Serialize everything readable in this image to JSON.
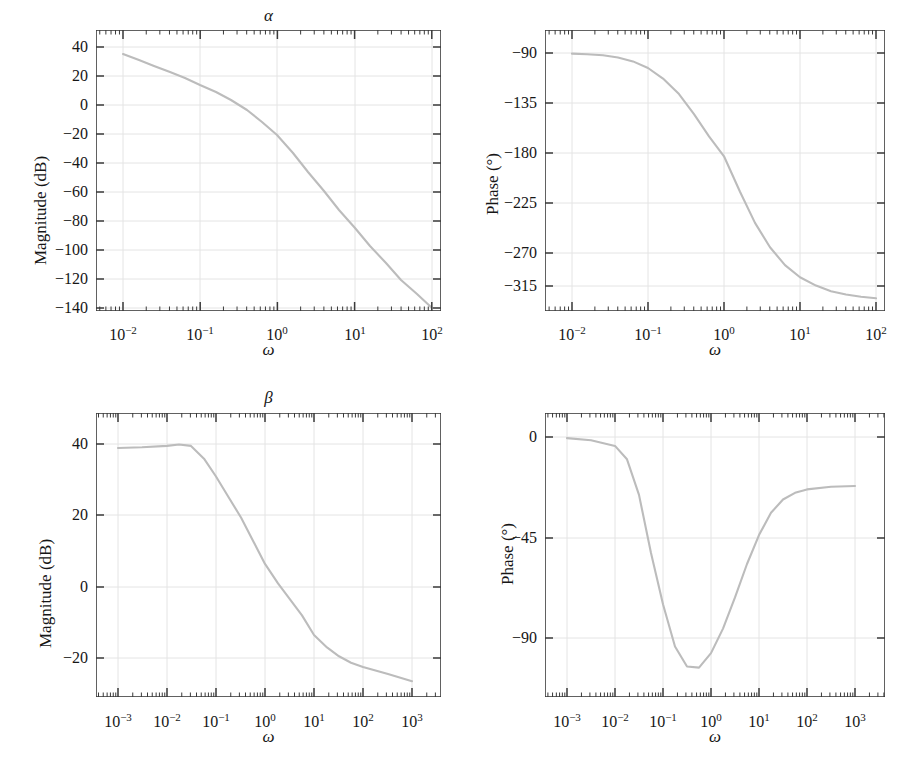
{
  "figure": {
    "background": "#ffffff",
    "curve_color": "#b9b9b9",
    "axis_color": "#3a3a3a",
    "grid_color": "#e2e2e2"
  },
  "panels": [
    {
      "id": "alpha-magnitude",
      "title": "α",
      "xlabel": "ω",
      "ylabel": "Magnitude (dB)",
      "yticks": [
        "40",
        "20",
        "0",
        "−20",
        "−40",
        "−60",
        "−80",
        "−100",
        "−120",
        "−140"
      ],
      "xticks": [
        "10⁻²",
        "10⁻¹",
        "10⁰",
        "10¹",
        "10²"
      ],
      "xtick_mantissa": [
        "10",
        "10",
        "10",
        "10",
        "10"
      ],
      "xtick_exponent": [
        "−2",
        "−1",
        "0",
        "1",
        "2"
      ]
    },
    {
      "id": "alpha-phase",
      "title": "",
      "xlabel": "ω",
      "ylabel": "Phase (°)",
      "yticks": [
        "−90",
        "−135",
        "−180",
        "−225",
        "−270",
        "−315"
      ],
      "xticks": [
        "10⁻²",
        "10⁻¹",
        "10⁰",
        "10¹",
        "10²"
      ],
      "xtick_mantissa": [
        "10",
        "10",
        "10",
        "10",
        "10"
      ],
      "xtick_exponent": [
        "−2",
        "−1",
        "0",
        "1",
        "2"
      ]
    },
    {
      "id": "beta-magnitude",
      "title": "β",
      "xlabel": "ω",
      "ylabel": "Magnitude (dB)",
      "yticks": [
        "40",
        "20",
        "0",
        "−20"
      ],
      "xticks": [
        "10⁻³",
        "10⁻²",
        "10⁻¹",
        "10⁰",
        "10¹",
        "10²",
        "10³"
      ],
      "xtick_mantissa": [
        "10",
        "10",
        "10",
        "10",
        "10",
        "10",
        "10"
      ],
      "xtick_exponent": [
        "−3",
        "−2",
        "−1",
        "0",
        "1",
        "2",
        "3"
      ]
    },
    {
      "id": "beta-phase",
      "title": "",
      "xlabel": "ω",
      "ylabel": "Phase (°)",
      "yticks": [
        "0",
        "−45",
        "−90"
      ],
      "xticks": [
        "10⁻³",
        "10⁻²",
        "10⁻¹",
        "10⁰",
        "10¹",
        "10²",
        "10³"
      ],
      "xtick_mantissa": [
        "10",
        "10",
        "10",
        "10",
        "10",
        "10",
        "10"
      ],
      "xtick_exponent": [
        "−3",
        "−2",
        "−1",
        "0",
        "1",
        "2",
        "3"
      ]
    }
  ],
  "chart_data": [
    {
      "type": "line",
      "id": "alpha-magnitude",
      "title": "α",
      "xlabel": "ω",
      "ylabel": "Magnitude (dB)",
      "xscale": "log",
      "xlim": [
        0.005,
        220
      ],
      "ylim": [
        -155,
        48
      ],
      "grid": true,
      "legend": "none",
      "ytick_values": [
        40,
        20,
        0,
        -20,
        -40,
        -60,
        -80,
        -100,
        -120,
        -140
      ],
      "xtick_values": [
        0.01,
        0.1,
        1,
        10,
        100
      ],
      "x": [
        0.01,
        0.0158,
        0.0251,
        0.0398,
        0.0631,
        0.1,
        0.158,
        0.251,
        0.398,
        0.631,
        1.0,
        1.58,
        2.51,
        3.98,
        6.31,
        10.0,
        15.8,
        25.1,
        39.8,
        63.1,
        100.0
      ],
      "y": [
        34.0,
        31.0,
        28.0,
        25.2,
        22.3,
        19.4,
        16.4,
        13.3,
        9.9,
        6.0,
        1.2,
        -4.7,
        -11.6,
        -19.2,
        -27.3,
        -35.8,
        -44.5,
        -53.4,
        -62.4,
        -71.5,
        -80.6
      ],
      "note": "magnitude falls from about 34 dB at w=0.01 to about -140 dB at w=100; slope steepens from -20 dB/dec to about -60 dB/dec"
    },
    {
      "type": "line",
      "id": "alpha-phase",
      "title": "",
      "xlabel": "ω",
      "ylabel": "Phase (°)",
      "xscale": "log",
      "xlim": [
        0.005,
        220
      ],
      "ylim": [
        -340,
        -78
      ],
      "grid": true,
      "legend": "none",
      "ytick_values": [
        -90,
        -135,
        -180,
        -225,
        -270,
        -315
      ],
      "xtick_values": [
        0.01,
        0.1,
        1,
        10,
        100
      ],
      "x": [
        0.01,
        0.0158,
        0.0251,
        0.0398,
        0.0631,
        0.1,
        0.158,
        0.251,
        0.398,
        0.631,
        1.0,
        1.58,
        2.51,
        3.98,
        6.31,
        10.0,
        15.8,
        25.1,
        39.8,
        63.1,
        100.0
      ],
      "y": [
        -90.5,
        -91.0,
        -92.0,
        -94.0,
        -97.5,
        -103.5,
        -113.0,
        -127.0,
        -145.0,
        -165.0,
        -183.0,
        -215.0,
        -243.0,
        -265.0,
        -281.0,
        -292.0,
        -299.5,
        -304.5,
        -307.5,
        -309.5,
        -311.0
      ],
      "note": "phase drops monotonically from -90 deg to about -313 deg"
    },
    {
      "type": "line",
      "id": "beta-magnitude",
      "title": "β",
      "xlabel": "ω",
      "ylabel": "Magnitude (dB)",
      "xscale": "log",
      "xlim": [
        0.0004,
        4000
      ],
      "ylim": [
        -33,
        48
      ],
      "grid": true,
      "legend": "none",
      "ytick_values": [
        40,
        20,
        0,
        -20
      ],
      "xtick_values": [
        0.001,
        0.01,
        0.1,
        1,
        10,
        100,
        1000
      ],
      "x": [
        0.001,
        0.00316,
        0.01,
        0.0178,
        0.0316,
        0.0562,
        0.1,
        0.178,
        0.316,
        0.562,
        1.0,
        1.78,
        3.16,
        5.62,
        10.0,
        17.8,
        31.6,
        56.2,
        100.0,
        316.0,
        1000.0
      ],
      "y": [
        41.0,
        41.2,
        41.6,
        42.0,
        41.6,
        38.0,
        33.0,
        27.5,
        21.5,
        15.0,
        8.5,
        3.0,
        -1.5,
        -6.0,
        -11.5,
        -15.0,
        -17.5,
        -19.3,
        -20.5,
        -22.5,
        -24.5
      ],
      "note": "flat about 41 dB below w=0.03, rolls off to about -24.5 dB at w=1000"
    },
    {
      "type": "line",
      "id": "beta-phase",
      "title": "",
      "xlabel": "ω",
      "ylabel": "Phase (°)",
      "xscale": "log",
      "xlim": [
        0.0004,
        4000
      ],
      "ylim": [
        -120,
        10
      ],
      "grid": true,
      "legend": "none",
      "ytick_values": [
        0,
        -45,
        -90
      ],
      "xtick_values": [
        0.001,
        0.01,
        0.1,
        1,
        10,
        100,
        1000
      ],
      "x": [
        0.001,
        0.00316,
        0.01,
        0.0178,
        0.0316,
        0.0562,
        0.1,
        0.178,
        0.316,
        0.562,
        1.0,
        1.78,
        3.16,
        5.62,
        10.0,
        17.8,
        31.6,
        56.2,
        100.0,
        316.0,
        1000.0
      ],
      "y": [
        -0.5,
        -1.5,
        -4.0,
        -10.0,
        -26.0,
        -52.0,
        -75.0,
        -94.0,
        -103.0,
        -103.5,
        -97.0,
        -86.0,
        -72.0,
        -57.0,
        -44.0,
        -34.0,
        -28.0,
        -25.0,
        -23.5,
        -22.3,
        -22.0
      ],
      "note": "starts near 0 deg, dips to about -104 deg near w=0.4, recovers to about -22 deg at w=1000"
    }
  ]
}
